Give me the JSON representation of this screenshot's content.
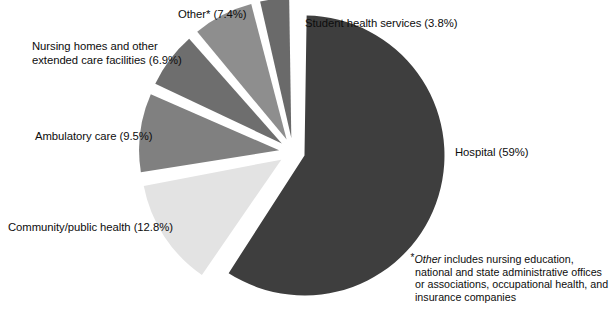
{
  "chart_data": {
    "type": "pie",
    "title": "",
    "subtitle": "",
    "xlabel": "",
    "ylabel": "",
    "legend_position": "none",
    "grid": false,
    "total_percent": 99.4,
    "start_angle_deg": 0,
    "direction": "clockwise",
    "categories": [
      "Hospital",
      "Community/public health",
      "Ambulatory care",
      "Nursing homes and other extended care facilities",
      "Other*",
      "Student health services"
    ],
    "values": [
      59,
      12.8,
      9.5,
      6.9,
      7.4,
      3.8
    ],
    "slices": [
      {
        "name": "hospital",
        "label": "Hospital (59%)",
        "category": "Hospital",
        "value": 59,
        "value_text": "59%",
        "color": "#3e3e3e",
        "exploded": true,
        "explode_px": 12
      },
      {
        "name": "community-public-health",
        "label": "Community/public health (12.8%)",
        "category": "Community/public health",
        "value": 12.8,
        "value_text": "12.8%",
        "color": "#e3e3e3",
        "exploded": true,
        "explode_px": 14
      },
      {
        "name": "ambulatory-care",
        "label": "Ambulatory care (9.5%)",
        "category": "Ambulatory care",
        "value": 9.5,
        "value_text": "9.5%",
        "color": "#808080",
        "exploded": true,
        "explode_px": 14
      },
      {
        "name": "nursing-homes",
        "label": "Nursing homes and other\nextended care facilities (6.9%)",
        "category": "Nursing homes and other extended care facilities",
        "value": 6.9,
        "value_text": "6.9%",
        "color": "#6e6e6e",
        "exploded": true,
        "explode_px": 14
      },
      {
        "name": "other",
        "label": "Other* (7.4%)",
        "category": "Other*",
        "value": 7.4,
        "value_text": "7.4%",
        "color": "#8e8e8e",
        "exploded": true,
        "explode_px": 14
      },
      {
        "name": "student-health-services",
        "label": "Student health services (3.8%)",
        "category": "Student health services",
        "value": 3.8,
        "value_text": "3.8%",
        "color": "#6a6a6a",
        "exploded": true,
        "explode_px": 14
      }
    ],
    "geometry": {
      "center_x": 293,
      "center_y": 152,
      "radius": 140
    },
    "annotations": {
      "footnote_marker": "*",
      "footnote_emphasis": "Other",
      "footnote_text": " includes nursing education, national and state administrative offices or associations, occupational health, and insurance companies"
    },
    "background_color": "#ffffff",
    "text_color": "#0d0d0d"
  },
  "labels": {
    "other": "Other* (7.4%)",
    "student": "Student health services (3.8%)",
    "nursing": "Nursing homes and other\nextended care facilities (6.9%)",
    "ambulatory": "Ambulatory care (9.5%)",
    "community": "Community/public health (12.8%)",
    "hospital": "Hospital (59%)"
  },
  "footnote": {
    "marker": "*",
    "emphasis": "Other",
    "rest": " includes nursing education, national and state administrative offices or associations, occupational health, and insurance companies"
  }
}
